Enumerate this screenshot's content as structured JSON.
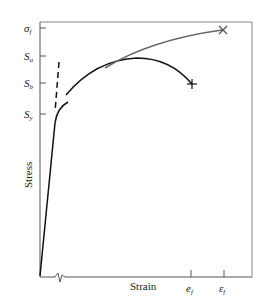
{
  "figure": {
    "type": "stress-strain diagram",
    "xlabel": "Strain",
    "ylabel": "Stress",
    "y_ticks": [
      {
        "label": "σ",
        "sub": "f",
        "y": 28
      },
      {
        "label": "S",
        "sub": "u",
        "y": 56
      },
      {
        "label": "S",
        "sub": "b",
        "y": 83
      },
      {
        "label": "S",
        "sub": "y",
        "y": 114
      }
    ],
    "x_ticks": [
      {
        "label": "e",
        "sub": "f",
        "x": 191
      },
      {
        "label": "ε",
        "sub": "f",
        "x": 224
      }
    ],
    "curves": [
      {
        "name": "engineering stress-strain",
        "color": "#111111",
        "end_marker": "+"
      },
      {
        "name": "true stress-strain",
        "color": "#666666",
        "end_marker": "×"
      }
    ],
    "axis_break": true,
    "colors": {
      "frame": "#888888",
      "curve_engineering": "#111111",
      "curve_true": "#666666"
    }
  }
}
